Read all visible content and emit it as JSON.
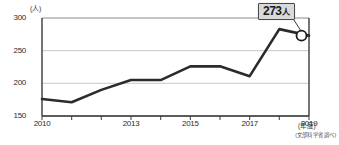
{
  "chart_data": {
    "type": "line",
    "title": "",
    "subtitle": "",
    "xlabel": "(年度)",
    "ylabel": "(人)",
    "x": [
      2010,
      2011,
      2012,
      2013,
      2014,
      2015,
      2016,
      2017,
      2018,
      2019
    ],
    "values": [
      176,
      171,
      190,
      205,
      205,
      226,
      226,
      211,
      283,
      273
    ],
    "series": [
      {
        "name": "人数",
        "values": [
          176,
          171,
          190,
          205,
          205,
          226,
          226,
          211,
          283,
          273
        ]
      }
    ],
    "xlim": [
      2010,
      2019
    ],
    "ylim": [
      150,
      300
    ],
    "yticks": [
      150,
      200,
      250,
      300
    ],
    "ytick_labels": [
      "150",
      "200",
      "250",
      "300"
    ],
    "xticks": [
      2010,
      2011,
      2012,
      2013,
      2014,
      2015,
      2016,
      2017,
      2018,
      2019
    ],
    "xtick_labels": [
      "2010",
      "",
      "",
      "2013",
      "",
      "2015",
      "",
      "2017",
      "",
      "2019"
    ],
    "grid": true,
    "grid_axis": "y",
    "legend": false,
    "legend_position": "none",
    "annotations": [
      {
        "label": "273人",
        "number": "273",
        "unit": "人",
        "x": 2019,
        "y": 273,
        "marker": "open-circle"
      }
    ],
    "source_note": "(文部科学省調べ)",
    "colors": {
      "line": "#2b2b2b",
      "grid": "#c8c8c8",
      "axis": "#3a3a3a",
      "marker_fill": "#ffffff",
      "marker_stroke": "#1a1a1a",
      "callout_bg": "#d9d9d9",
      "callout_border": "#4a4a4a",
      "background": "#ffffff",
      "text": "#2b2b2b"
    }
  }
}
